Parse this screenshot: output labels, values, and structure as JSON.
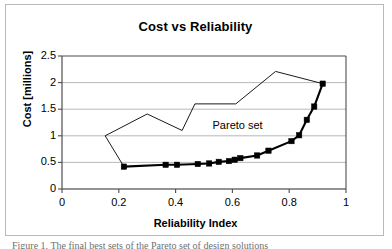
{
  "figure": {
    "caption": "Figure 1.  The final best sets of the Pareto set of design solutions"
  },
  "chart_data": {
    "type": "line",
    "title": "Cost vs Reliability",
    "xlabel": "Reliability Index",
    "ylabel": "Cost [millions]",
    "xlim": [
      0,
      1
    ],
    "ylim": [
      0,
      2.5
    ],
    "xticks": [
      "0",
      "0.2",
      "0.4",
      "0.6",
      "0.8",
      "1"
    ],
    "xtick_values": [
      0,
      0.2,
      0.4,
      0.6,
      0.8,
      1
    ],
    "yticks": [
      "0",
      "0.5",
      "1",
      "1.5",
      "2",
      "2.5"
    ],
    "ytick_values": [
      0,
      0.5,
      1,
      1.5,
      2,
      2.5
    ],
    "grid": "horizontal",
    "legend": "none",
    "annotations": [
      {
        "text": "Pareto set",
        "x": 0.53,
        "y": 1.18
      }
    ],
    "series": [
      {
        "name": "Pareto frontier",
        "style": "thick-line-with-square-markers",
        "color": "#000000",
        "markers": true,
        "points": [
          {
            "x": 0.218,
            "y": 0.42
          },
          {
            "x": 0.365,
            "y": 0.455
          },
          {
            "x": 0.405,
            "y": 0.455
          },
          {
            "x": 0.478,
            "y": 0.47
          },
          {
            "x": 0.518,
            "y": 0.48
          },
          {
            "x": 0.552,
            "y": 0.51
          },
          {
            "x": 0.588,
            "y": 0.525
          },
          {
            "x": 0.608,
            "y": 0.55
          },
          {
            "x": 0.628,
            "y": 0.58
          },
          {
            "x": 0.687,
            "y": 0.63
          },
          {
            "x": 0.727,
            "y": 0.72
          },
          {
            "x": 0.808,
            "y": 0.9
          },
          {
            "x": 0.835,
            "y": 1.01
          },
          {
            "x": 0.862,
            "y": 1.3
          },
          {
            "x": 0.888,
            "y": 1.55
          },
          {
            "x": 0.918,
            "y": 1.98
          }
        ]
      },
      {
        "name": "Design space boundary",
        "style": "thin-line",
        "color": "#000000",
        "markers": false,
        "points": [
          {
            "x": 0.218,
            "y": 0.42
          },
          {
            "x": 0.152,
            "y": 1.0
          },
          {
            "x": 0.3,
            "y": 1.41
          },
          {
            "x": 0.423,
            "y": 1.1
          },
          {
            "x": 0.468,
            "y": 1.6
          },
          {
            "x": 0.612,
            "y": 1.6
          },
          {
            "x": 0.752,
            "y": 2.21
          },
          {
            "x": 0.918,
            "y": 1.98
          }
        ]
      }
    ]
  }
}
